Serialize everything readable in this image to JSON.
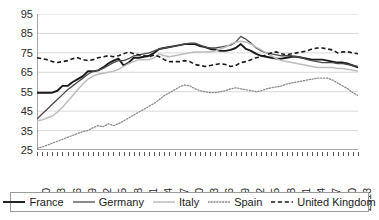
{
  "chart_data": {
    "type": "line",
    "title": "",
    "xlabel": "",
    "ylabel": "",
    "ylim": [
      25,
      95
    ],
    "ytick_values": [
      25,
      35,
      45,
      55,
      65,
      75,
      85,
      95
    ],
    "grid": true,
    "legend_position": "bottom",
    "x_start": 1950,
    "x_end": 2013,
    "xtick_labels": [
      "1950",
      "1953",
      "1956",
      "1959",
      "1962",
      "1965",
      "1968",
      "1971",
      "1974",
      "1977",
      "1980",
      "1983",
      "1986",
      "1989",
      "1992",
      "1995",
      "1998",
      "2001",
      "2004",
      "2007",
      "2010",
      "2013"
    ],
    "x": [
      1950,
      1951,
      1952,
      1953,
      1954,
      1955,
      1956,
      1957,
      1958,
      1959,
      1960,
      1961,
      1962,
      1963,
      1964,
      1965,
      1966,
      1967,
      1968,
      1969,
      1970,
      1971,
      1972,
      1973,
      1974,
      1975,
      1976,
      1977,
      1978,
      1979,
      1980,
      1981,
      1982,
      1983,
      1984,
      1985,
      1986,
      1987,
      1988,
      1989,
      1990,
      1991,
      1992,
      1993,
      1994,
      1995,
      1996,
      1997,
      1998,
      1999,
      2000,
      2001,
      2002,
      2003,
      2004,
      2005,
      2006,
      2007,
      2008,
      2009,
      2010,
      2011,
      2012,
      2013
    ],
    "series": [
      {
        "name": "France",
        "style": "solid",
        "color": "#1a1a1a",
        "width": 1.9,
        "values": [
          54.5,
          54.5,
          54.5,
          54.5,
          55.5,
          58.0,
          58.0,
          60.0,
          61.5,
          63.0,
          65.5,
          65.5,
          66.0,
          67.5,
          69.5,
          71.0,
          72.0,
          68.5,
          70.0,
          72.5,
          72.5,
          73.0,
          73.5,
          75.0,
          77.0,
          77.5,
          78.0,
          78.5,
          79.0,
          79.5,
          79.5,
          79.5,
          78.5,
          78.0,
          77.0,
          76.5,
          76.0,
          76.0,
          76.5,
          77.5,
          79.5,
          77.0,
          76.0,
          74.5,
          73.5,
          73.0,
          72.5,
          72.0,
          72.0,
          72.5,
          73.0,
          73.0,
          72.5,
          72.0,
          71.5,
          71.5,
          71.5,
          71.0,
          70.5,
          70.0,
          70.0,
          69.5,
          68.5,
          67.5
        ]
      },
      {
        "name": "Germany",
        "style": "solid",
        "color": "#4a4a4a",
        "width": 1.3,
        "values": [
          41.0,
          43.5,
          46.0,
          48.5,
          51.0,
          53.5,
          56.0,
          58.0,
          60.0,
          62.0,
          64.0,
          65.5,
          66.0,
          67.0,
          68.5,
          70.0,
          71.0,
          71.0,
          72.0,
          73.5,
          74.0,
          74.5,
          75.0,
          76.0,
          77.0,
          77.5,
          78.0,
          78.5,
          79.0,
          79.5,
          80.0,
          80.0,
          79.0,
          78.0,
          77.5,
          77.5,
          78.0,
          78.5,
          79.0,
          80.5,
          83.5,
          82.0,
          80.0,
          77.5,
          76.0,
          75.0,
          74.5,
          74.0,
          73.5,
          73.5,
          73.5,
          73.0,
          72.5,
          71.5,
          71.0,
          70.5,
          70.0,
          70.0,
          70.0,
          69.5,
          69.5,
          69.0,
          68.5,
          68.0
        ]
      },
      {
        "name": "Italy",
        "style": "solid",
        "color": "#bdbdbd",
        "width": 1.5,
        "values": [
          40.0,
          40.5,
          41.5,
          42.5,
          44.5,
          47.0,
          50.0,
          53.0,
          56.0,
          59.0,
          61.5,
          63.0,
          64.0,
          64.5,
          65.0,
          65.5,
          66.5,
          68.0,
          69.5,
          70.5,
          71.5,
          71.5,
          71.5,
          72.5,
          74.5,
          73.5,
          73.0,
          73.5,
          74.0,
          74.5,
          75.0,
          75.5,
          75.5,
          75.5,
          75.5,
          76.0,
          77.0,
          78.0,
          79.5,
          80.5,
          81.0,
          80.5,
          79.5,
          78.0,
          76.5,
          75.0,
          73.5,
          72.0,
          71.0,
          70.5,
          70.0,
          69.5,
          69.0,
          68.5,
          68.0,
          67.5,
          67.5,
          67.5,
          67.5,
          67.0,
          67.0,
          66.5,
          66.0,
          65.5
        ]
      },
      {
        "name": "Spain",
        "style": "dotted",
        "color": "#8a8a8a",
        "width": 1.3,
        "values": [
          26.0,
          26.5,
          27.5,
          28.5,
          29.5,
          30.5,
          31.5,
          32.5,
          33.5,
          34.5,
          35.0,
          36.5,
          37.5,
          37.0,
          38.5,
          37.5,
          38.5,
          40.0,
          41.5,
          43.0,
          44.5,
          46.0,
          47.5,
          49.0,
          51.0,
          53.0,
          54.5,
          56.0,
          57.5,
          58.5,
          58.0,
          56.5,
          55.5,
          55.0,
          54.5,
          54.5,
          55.0,
          55.5,
          56.5,
          57.0,
          56.5,
          56.0,
          55.5,
          55.0,
          55.5,
          56.5,
          57.0,
          57.5,
          58.0,
          59.0,
          59.5,
          60.0,
          60.5,
          61.0,
          61.5,
          62.0,
          62.0,
          62.0,
          61.0,
          59.5,
          58.0,
          56.5,
          54.5,
          53.0
        ]
      },
      {
        "name": "United Kingdom",
        "style": "dashed",
        "color": "#1a1a1a",
        "width": 1.6,
        "values": [
          72.5,
          72.0,
          71.5,
          70.5,
          70.0,
          70.5,
          71.0,
          72.0,
          72.5,
          71.5,
          71.0,
          71.5,
          72.5,
          73.0,
          73.5,
          73.0,
          73.5,
          74.5,
          75.5,
          74.5,
          74.0,
          73.5,
          73.0,
          74.0,
          73.0,
          71.5,
          70.5,
          70.5,
          70.5,
          71.0,
          70.5,
          69.0,
          68.5,
          68.0,
          68.5,
          69.0,
          69.5,
          69.0,
          68.0,
          68.5,
          70.0,
          70.5,
          71.5,
          72.5,
          73.0,
          74.0,
          75.0,
          75.5,
          74.5,
          74.0,
          74.5,
          75.0,
          75.5,
          76.0,
          77.0,
          77.5,
          77.5,
          77.0,
          76.5,
          75.0,
          75.5,
          75.5,
          75.0,
          74.5
        ]
      }
    ]
  },
  "legend": {
    "items": [
      {
        "label": "France"
      },
      {
        "label": "Germany"
      },
      {
        "label": "Italy"
      },
      {
        "label": "Spain"
      },
      {
        "label": "United Kingdom"
      }
    ]
  }
}
